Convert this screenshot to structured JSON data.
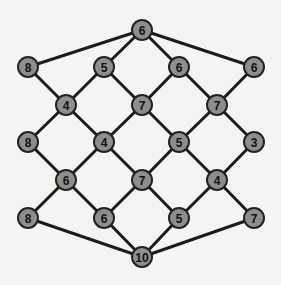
{
  "diagram": {
    "type": "lattice-graph",
    "node_color": "#8e8e8e",
    "edge_color": "#1c1c1c",
    "background": "#f4f4f2",
    "nodes": [
      {
        "id": "n0",
        "label": "6",
        "x": 142,
        "y": 30
      },
      {
        "id": "n1",
        "label": "8",
        "x": 28,
        "y": 67
      },
      {
        "id": "n2",
        "label": "5",
        "x": 104,
        "y": 67
      },
      {
        "id": "n3",
        "label": "6",
        "x": 179,
        "y": 67
      },
      {
        "id": "n4",
        "label": "6",
        "x": 254,
        "y": 67
      },
      {
        "id": "n5",
        "label": "4",
        "x": 66,
        "y": 105
      },
      {
        "id": "n6",
        "label": "7",
        "x": 142,
        "y": 105
      },
      {
        "id": "n7",
        "label": "7",
        "x": 217,
        "y": 105
      },
      {
        "id": "n8",
        "label": "8",
        "x": 28,
        "y": 142
      },
      {
        "id": "n9",
        "label": "4",
        "x": 104,
        "y": 142
      },
      {
        "id": "n10",
        "label": "5",
        "x": 179,
        "y": 142
      },
      {
        "id": "n11",
        "label": "3",
        "x": 254,
        "y": 142
      },
      {
        "id": "n12",
        "label": "6",
        "x": 66,
        "y": 180
      },
      {
        "id": "n13",
        "label": "7",
        "x": 142,
        "y": 180
      },
      {
        "id": "n14",
        "label": "4",
        "x": 217,
        "y": 180
      },
      {
        "id": "n15",
        "label": "8",
        "x": 28,
        "y": 218
      },
      {
        "id": "n16",
        "label": "6",
        "x": 104,
        "y": 218
      },
      {
        "id": "n17",
        "label": "5",
        "x": 179,
        "y": 218
      },
      {
        "id": "n18",
        "label": "7",
        "x": 254,
        "y": 218
      },
      {
        "id": "n19",
        "label": "10",
        "x": 142,
        "y": 257
      }
    ],
    "edges": [
      [
        "n0",
        "n1"
      ],
      [
        "n0",
        "n2"
      ],
      [
        "n0",
        "n3"
      ],
      [
        "n0",
        "n4"
      ],
      [
        "n1",
        "n5"
      ],
      [
        "n2",
        "n5"
      ],
      [
        "n2",
        "n6"
      ],
      [
        "n3",
        "n6"
      ],
      [
        "n3",
        "n7"
      ],
      [
        "n4",
        "n7"
      ],
      [
        "n5",
        "n8"
      ],
      [
        "n5",
        "n9"
      ],
      [
        "n6",
        "n9"
      ],
      [
        "n6",
        "n10"
      ],
      [
        "n7",
        "n10"
      ],
      [
        "n7",
        "n11"
      ],
      [
        "n8",
        "n12"
      ],
      [
        "n9",
        "n12"
      ],
      [
        "n9",
        "n13"
      ],
      [
        "n10",
        "n13"
      ],
      [
        "n10",
        "n14"
      ],
      [
        "n11",
        "n14"
      ],
      [
        "n12",
        "n15"
      ],
      [
        "n12",
        "n16"
      ],
      [
        "n13",
        "n16"
      ],
      [
        "n13",
        "n17"
      ],
      [
        "n14",
        "n17"
      ],
      [
        "n14",
        "n18"
      ],
      [
        "n15",
        "n19"
      ],
      [
        "n16",
        "n19"
      ],
      [
        "n17",
        "n19"
      ],
      [
        "n18",
        "n19"
      ]
    ]
  }
}
